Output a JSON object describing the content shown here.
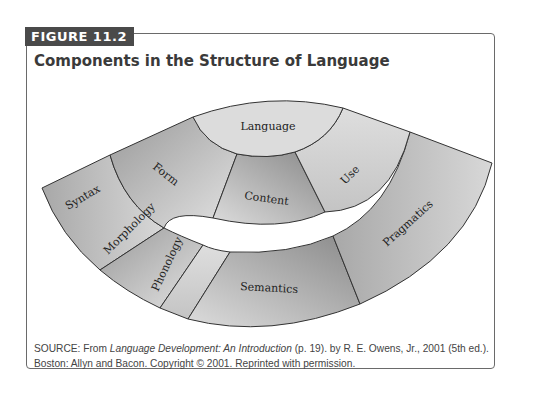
{
  "figure": {
    "label": "FIGURE 11.2",
    "title": "Components in the Structure of Language"
  },
  "diagram": {
    "center": "Language",
    "middle": [
      "Form",
      "Content",
      "Use"
    ],
    "outer": [
      "Syntax",
      "Morphology",
      "Phonology",
      "Semantics",
      "Pragmatics"
    ],
    "colors": {
      "light": "#e6e6e6",
      "mid": "#b4b4b4",
      "dark": "#8c8c8c",
      "stroke": "#333333"
    }
  },
  "source": {
    "prefix": "SOURCE: From ",
    "book": "Language Development: An Introduction",
    "rest1": " (p. 19). by R. E. Owens, Jr., 2001 (5th ed.).",
    "line2": "Boston: Allyn and Bacon. Copyright © 2001. Reprinted with permission."
  }
}
